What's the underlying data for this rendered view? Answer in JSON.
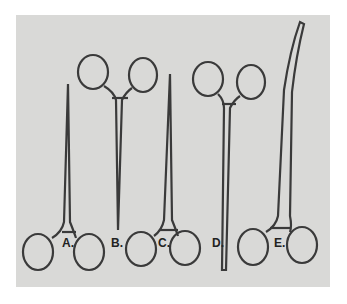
{
  "photo": {
    "background_color": "#d9d9d7",
    "subject": "five surgical hemostat forceps"
  },
  "instruments": [
    {
      "label": "A.",
      "x": 62,
      "y": 236
    },
    {
      "label": "B.",
      "x": 111,
      "y": 236
    },
    {
      "label": "C.",
      "x": 158,
      "y": 236
    },
    {
      "label": "D.",
      "x": 212,
      "y": 236
    },
    {
      "label": "E.",
      "x": 274,
      "y": 236
    }
  ]
}
